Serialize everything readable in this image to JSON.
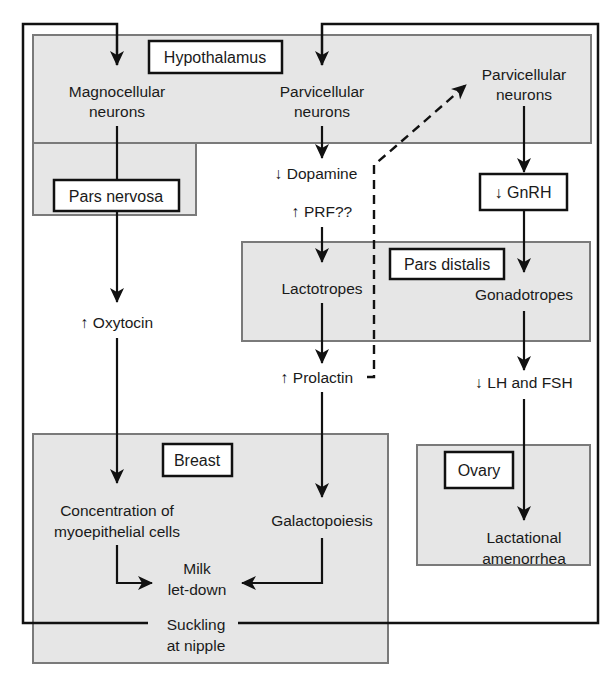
{
  "regions": {
    "hypothalamus": "Hypothalamus",
    "pars_nervosa": "Pars nervosa",
    "pars_distalis": "Pars distalis",
    "breast": "Breast",
    "ovary": "Ovary"
  },
  "nodes": {
    "magnocellular_1": "Magnocellular",
    "magnocellular_2": "neurons",
    "parvicellular_a_1": "Parvicellular",
    "parvicellular_a_2": "neurons",
    "parvicellular_b_1": "Parvicellular",
    "parvicellular_b_2": "neurons",
    "dopamine": "↓ Dopamine",
    "prf": "↑ PRF??",
    "gnrh": "↓ GnRH",
    "oxytocin": "↑ Oxytocin",
    "lactotropes": "Lactotropes",
    "gonadotropes": "Gonadotropes",
    "prolactin": "↑ Prolactin",
    "lh_fsh": "↓ LH and FSH",
    "myoepithelial_1": "Concentration of",
    "myoepithelial_2": "myoepithelial cells",
    "galactopoiesis": "Galactopoiesis",
    "milk_1": "Milk",
    "milk_2": "let-down",
    "amenorrhea_1": "Lactational",
    "amenorrhea_2": "amenorrhea",
    "suckling_1": "Suckling",
    "suckling_2": "at nipple"
  },
  "colors": {
    "region_fill": "#e6e6e6",
    "region_stroke": "#7a7a7a",
    "line": "#111111",
    "label_box_fill": "#ffffff"
  }
}
